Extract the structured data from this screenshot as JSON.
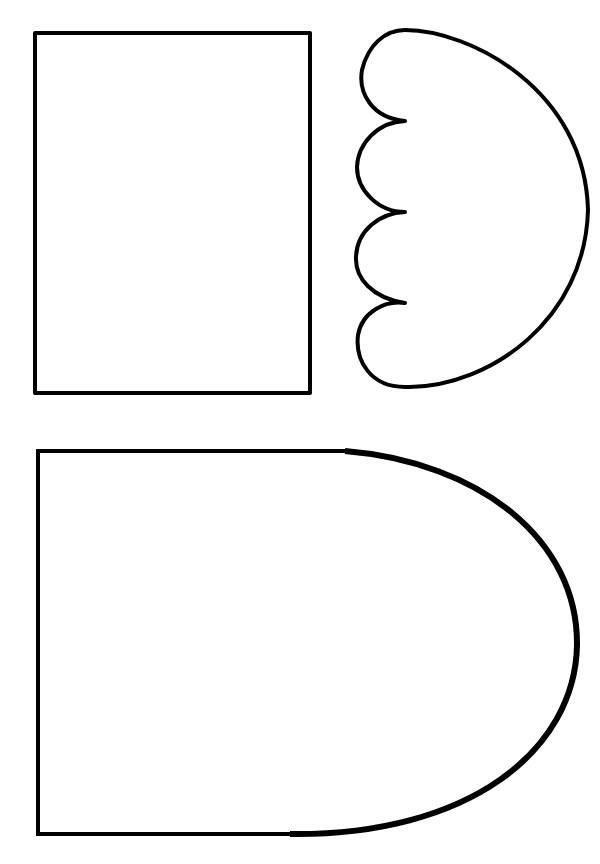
{
  "page": {
    "background": "#ffffff",
    "stroke_color": "#000000"
  },
  "shapes": [
    {
      "id": "rectangle",
      "label": "",
      "x": 35,
      "y": 33,
      "width": 275,
      "height": 360
    },
    {
      "id": "scalloped-half-circle",
      "label": "",
      "scallops": 4
    },
    {
      "id": "arch-shape",
      "label": "",
      "x": 38,
      "y": 451,
      "width": 541,
      "height": 385
    }
  ]
}
